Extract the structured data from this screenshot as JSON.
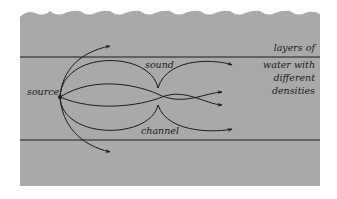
{
  "diagram": {
    "colors": {
      "background": "#ffffff",
      "water": "#a9a9a9",
      "lines": "#1a1a1a"
    },
    "labels": {
      "source": "source",
      "sound": "sound",
      "channel": "channel",
      "layers_line1": "layers of",
      "layers_line2": "water with",
      "layers_line3": "different",
      "layers_line4": "densities"
    },
    "elements": {
      "surface": "wavy-water-surface",
      "upper_boundary": "upper-layer-boundary-line",
      "lower_boundary": "lower-layer-boundary-line",
      "source_point": "sound-source-point",
      "rays": [
        "escaping-ray-up",
        "trapped-ray-outer-top",
        "trapped-ray-inner-top",
        "trapped-ray-inner-bottom",
        "trapped-ray-outer-bottom",
        "escaping-ray-down"
      ]
    }
  }
}
